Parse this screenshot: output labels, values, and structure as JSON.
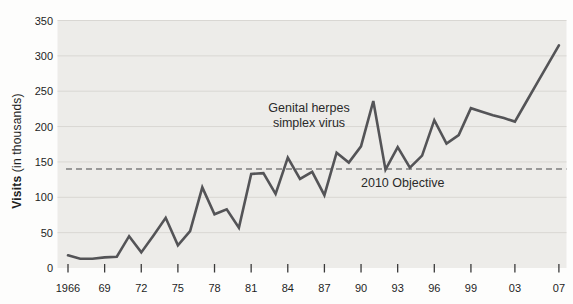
{
  "y_axis_title": {
    "bold_part": "Visits",
    "regular_part": " (in thousands)"
  },
  "annotation": {
    "line1": "Genital herpes",
    "line2": "simplex virus"
  },
  "objective_label": "2010 Objective",
  "chart_data": {
    "type": "line",
    "title": "",
    "xlabel": "",
    "ylabel": "Visits (in thousands)",
    "ylim": [
      0,
      350
    ],
    "ytick_step": 50,
    "grid": "horizontal",
    "legend_position": "none",
    "series_label": "Genital herpes simplex virus",
    "start_year": 1966,
    "end_year": 2007,
    "values": [
      18,
      13,
      13,
      15,
      16,
      45,
      22,
      46,
      71,
      32,
      52,
      114,
      76,
      83,
      57,
      133,
      134,
      105,
      156,
      126,
      136,
      103,
      163,
      149,
      172,
      236,
      139,
      171,
      142,
      159,
      209,
      176,
      188,
      226,
      221,
      216,
      212,
      207,
      234,
      261,
      288,
      315
    ],
    "x_tick_years": [
      1966,
      1969,
      1972,
      1975,
      1978,
      1981,
      1984,
      1987,
      1990,
      1993,
      1996,
      1999,
      2003,
      2007
    ],
    "x_tick_labels": [
      "1966",
      "69",
      "72",
      "75",
      "78",
      "81",
      "84",
      "87",
      "90",
      "93",
      "96",
      "99",
      "03",
      "07"
    ],
    "y_tick_values": [
      0,
      50,
      100,
      150,
      200,
      250,
      300,
      350
    ],
    "objective": {
      "value": 140,
      "label": "2010 Objective"
    },
    "colors": {
      "line": "#545457",
      "objective_dash": "#7d7d7d",
      "plot_bg": "#edece9",
      "gridline": "#d9d7d3",
      "tick": "#3a3a3a",
      "text": "#1e1e1e"
    }
  }
}
